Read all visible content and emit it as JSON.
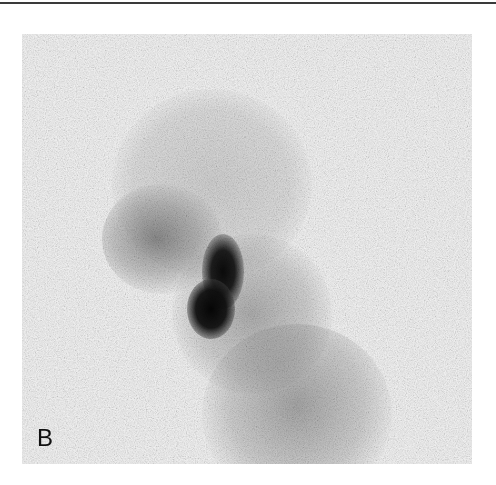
{
  "figure": {
    "panel_label": "B"
  },
  "colors": {
    "background": "#ffffff",
    "panel_background": "#f1f1f1",
    "rule": "#3a3a3a",
    "hotspot": "#0a0a0a"
  }
}
